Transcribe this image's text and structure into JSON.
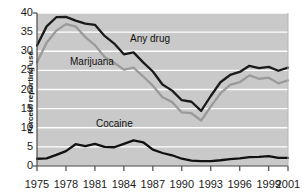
{
  "chart_data": {
    "type": "line",
    "title": "",
    "subtitle": "",
    "xlabel": "",
    "ylabel": "Percent reporting use",
    "xlim": [
      1975,
      2001
    ],
    "ylim": [
      0,
      40
    ],
    "grid": "horizontal",
    "legend_position": "inline-annotations",
    "x_tick_labels": [
      "1975",
      "1978",
      "1981",
      "1984",
      "1987",
      "1990",
      "1993",
      "1996",
      "1999",
      "2001"
    ],
    "x_tick_values": [
      1975,
      1978,
      1981,
      1984,
      1987,
      1990,
      1993,
      1996,
      1999,
      2001
    ],
    "y_tick_labels": [
      "0",
      "5",
      "10",
      "15",
      "20",
      "25",
      "30",
      "35",
      "40"
    ],
    "y_tick_values": [
      0,
      5,
      10,
      15,
      20,
      25,
      30,
      35,
      40
    ],
    "x": [
      1975,
      1976,
      1977,
      1978,
      1979,
      1980,
      1981,
      1982,
      1983,
      1984,
      1985,
      1986,
      1987,
      1988,
      1989,
      1990,
      1991,
      1992,
      1993,
      1994,
      1995,
      1996,
      1997,
      1998,
      1999,
      2000,
      2001
    ],
    "series": [
      {
        "name": "Any drug",
        "color": "#1a1a1a",
        "annotation": "Any drug",
        "values": [
          31.5,
          36.5,
          38.9,
          39.0,
          38.0,
          37.2,
          36.9,
          34.0,
          32.0,
          29.2,
          29.7,
          27.1,
          24.7,
          21.3,
          19.7,
          17.2,
          16.8,
          14.4,
          18.3,
          21.9,
          23.8,
          24.6,
          26.2,
          25.6,
          25.9,
          24.9,
          25.7
        ]
      },
      {
        "name": "Marijuana",
        "color": "#9a9a9a",
        "annotation": "Marijuana",
        "values": [
          27.1,
          32.2,
          35.4,
          37.1,
          36.5,
          33.7,
          31.6,
          28.5,
          27.0,
          25.2,
          25.7,
          23.4,
          21.0,
          18.0,
          16.7,
          14.0,
          13.8,
          11.9,
          15.5,
          19.0,
          21.2,
          21.9,
          23.7,
          22.8,
          23.1,
          21.6,
          22.4
        ]
      },
      {
        "name": "Cocaine",
        "color": "#111111",
        "annotation": "Cocaine",
        "values": [
          1.9,
          2.0,
          2.9,
          3.9,
          5.7,
          5.2,
          5.8,
          5.0,
          4.9,
          5.8,
          6.7,
          6.2,
          4.3,
          3.4,
          2.8,
          1.9,
          1.4,
          1.3,
          1.3,
          1.5,
          1.8,
          2.0,
          2.3,
          2.4,
          2.6,
          2.1,
          2.1
        ]
      }
    ]
  },
  "colors": {
    "plot_background": "#c9c9c9",
    "gridline": "#ffffff",
    "axis": "#4a4a4a",
    "any_drug": "#1a1a1a",
    "marijuana": "#9a9a9a",
    "cocaine": "#111111"
  },
  "annotations": {
    "any_drug": "Any drug",
    "marijuana": "Marijuana",
    "cocaine": "Cocaine"
  }
}
